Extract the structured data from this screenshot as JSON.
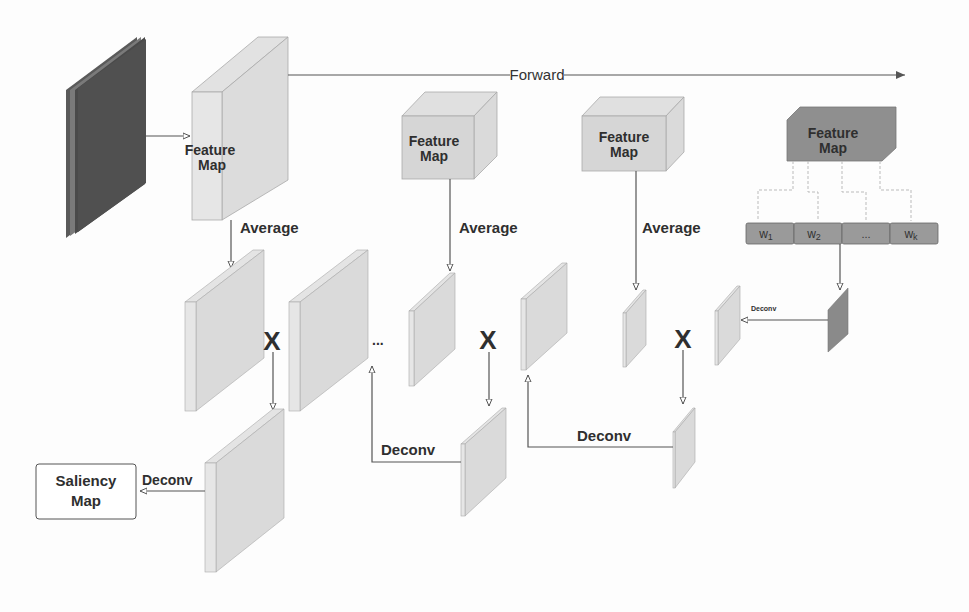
{
  "diagram": {
    "title": "",
    "labels": {
      "forward": "Forward",
      "feature_map_line1": "Feature",
      "feature_map_line2": "Map",
      "average": "Average",
      "deconv": "Deconv",
      "saliency_line1": "Saliency",
      "saliency_line2": "Map",
      "multiply": "X",
      "ellipsis": "..."
    },
    "feature_maps": [
      {
        "id": "fm1",
        "label": "Feature Map"
      },
      {
        "id": "fm2",
        "label": "Feature Map"
      },
      {
        "id": "fm3",
        "label": "Feature Map"
      },
      {
        "id": "fm4",
        "label": "Feature Map",
        "style": "dark"
      }
    ],
    "weights": [
      "w1",
      "w2",
      "...",
      "wk"
    ],
    "weight_labels": {
      "w1_main": "w",
      "w1_sub": "1",
      "w2_main": "w",
      "w2_sub": "2",
      "dots": "...",
      "wk_main": "w",
      "wk_sub": "k"
    },
    "steps": [
      "Average",
      "Average",
      "Average"
    ],
    "deconv_steps": [
      "Deconv",
      "Deconv",
      "Deconv",
      "Deconv"
    ],
    "output": "Saliency Map",
    "colors": {
      "input_dark": "#4a4a4a",
      "map_light": "#d8d8d8",
      "map_side": "#e4e4e4",
      "dark_map": "#8c8c8c",
      "line": "#555555",
      "text": "#2f2f2f"
    }
  }
}
